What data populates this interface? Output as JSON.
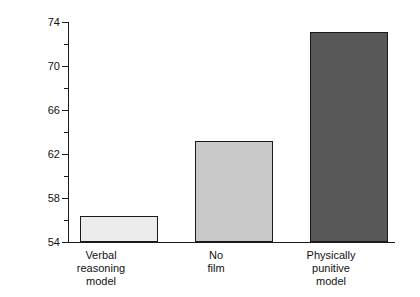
{
  "chart_data": {
    "type": "bar",
    "title": "",
    "xlabel": "",
    "ylabel": "Mean intensity of aggression",
    "categories": [
      "Verbal\nreasoning\nmodel",
      "No\nfilm",
      "Physically\npunitive\nmodel"
    ],
    "category_lines": [
      [
        "Verbal",
        "reasoning",
        "model"
      ],
      [
        "No",
        "film"
      ],
      [
        "Physically",
        "punitive",
        "model"
      ]
    ],
    "values": [
      56.4,
      63.2,
      73.1
    ],
    "bar_colors": [
      "#ececec",
      "#c9c9c9",
      "#585858"
    ],
    "bar_edge_color": "#1a1a1a",
    "ylim": [
      54,
      74
    ],
    "ytick_major": [
      54,
      58,
      62,
      66,
      70,
      74
    ],
    "ytick_minor": [
      56,
      60,
      64,
      68,
      72
    ],
    "ytick_labels": [
      "54",
      "58",
      "62",
      "66",
      "70",
      "74"
    ],
    "grid": false,
    "legend": null,
    "background": "#ffffff"
  },
  "axis": {
    "y_labels": {
      "t74": "74",
      "t70": "70",
      "t66": "66",
      "t62": "62",
      "t58": "58",
      "t54": "54"
    },
    "y_title": "Mean intensity of aggression"
  },
  "bars": [
    {
      "value": 56.4,
      "color": "#ececec",
      "label_line1": "Verbal",
      "label_line2": "reasoning",
      "label_line3": "model"
    },
    {
      "value": 63.2,
      "color": "#c9c9c9",
      "label_line1": "No",
      "label_line2": "film",
      "label_line3": ""
    },
    {
      "value": 73.1,
      "color": "#585858",
      "label_line1": "Physically",
      "label_line2": "punitive",
      "label_line3": "model"
    }
  ]
}
